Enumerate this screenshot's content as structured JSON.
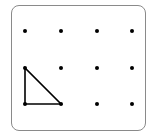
{
  "geoboard": {
    "columns": 4,
    "rows": 3,
    "dots": [
      {
        "col": 0,
        "row": 0
      },
      {
        "col": 1,
        "row": 0
      },
      {
        "col": 2,
        "row": 0
      },
      {
        "col": 3,
        "row": 0
      },
      {
        "col": 0,
        "row": 1
      },
      {
        "col": 1,
        "row": 1
      },
      {
        "col": 2,
        "row": 1
      },
      {
        "col": 3,
        "row": 1
      },
      {
        "col": 0,
        "row": 2
      },
      {
        "col": 1,
        "row": 2
      },
      {
        "col": 2,
        "row": 2
      },
      {
        "col": 3,
        "row": 2
      }
    ],
    "shape": {
      "type": "right-triangle",
      "vertices": [
        {
          "col": 0,
          "row": 1
        },
        {
          "col": 0,
          "row": 2
        },
        {
          "col": 1,
          "row": 2
        }
      ]
    },
    "colors": {
      "dot": "#000000",
      "line": "#000000",
      "border": "#8a8a8a"
    }
  }
}
